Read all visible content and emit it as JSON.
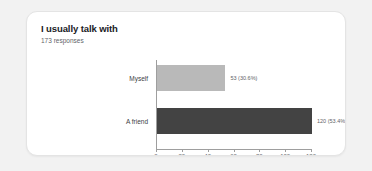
{
  "card": {
    "title": "I usually talk with",
    "subtitle": "173 responses"
  },
  "colors": {
    "page_background": "#f2f2f2",
    "card_background": "#ffffff",
    "title_text": "#202124",
    "subtitle_text": "#5f6368",
    "bar_light": "#b9b9b9",
    "bar_dark": "#434343",
    "axis": "#9e9e9e"
  },
  "chart_data": {
    "type": "bar",
    "orientation": "horizontal",
    "title": "I usually talk with",
    "subtitle": "173 responses",
    "total_responses": 173,
    "categories": [
      "Myself",
      "A friend"
    ],
    "values": [
      53,
      120
    ],
    "percents": [
      "30.6%",
      "53.4%"
    ],
    "data_labels": [
      "53 (30.6%)",
      "120 (53.4%)"
    ],
    "bar_colors": [
      "#b9b9b9",
      "#434343"
    ],
    "xlabel": "",
    "ylabel": "",
    "xlim": [
      0,
      120
    ],
    "xticks": [
      0,
      20,
      40,
      60,
      80,
      100,
      120
    ],
    "xtick_labels": [
      "0",
      "20",
      "40",
      "60",
      "80",
      "100",
      "120"
    ],
    "grid": false,
    "legend": false
  }
}
